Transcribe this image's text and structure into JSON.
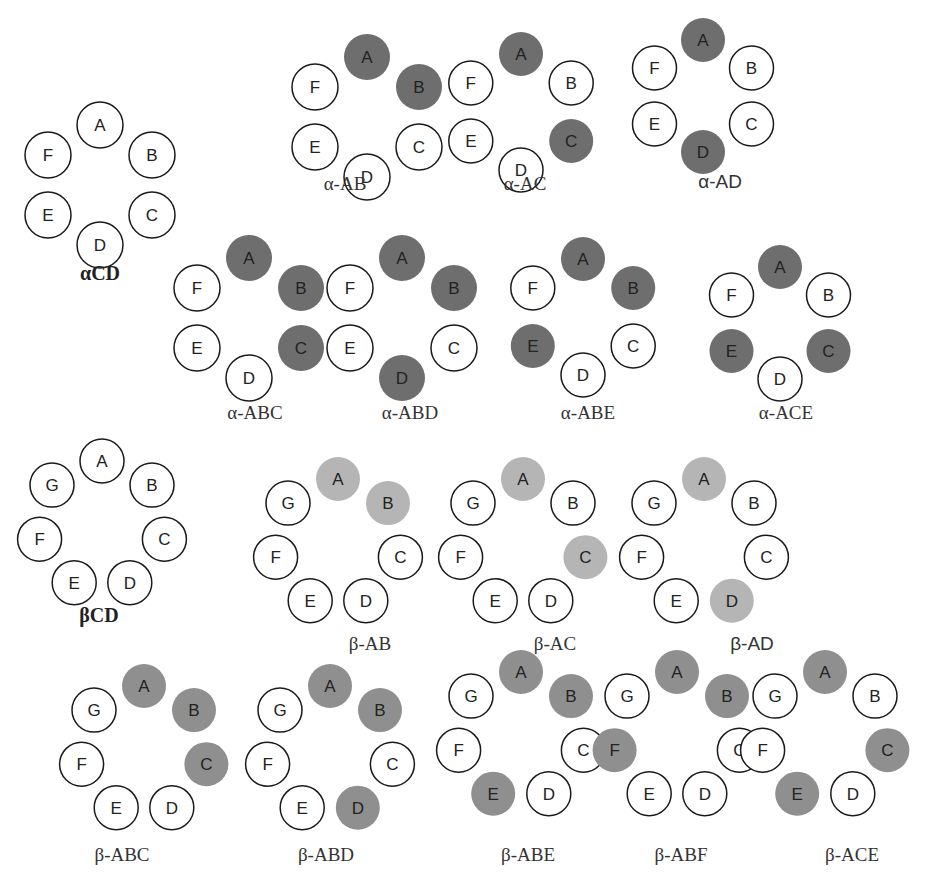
{
  "figure": {
    "colors": {
      "unsubstituted_fill": "#ffffff",
      "outline": "#1a1a1a",
      "alpha_substituted": "#6e6e6e",
      "beta_light_substituted": "#b5b5b5",
      "beta_substituted": "#8f8f8f"
    }
  },
  "diagrams": [
    {
      "id": "alpha-cd",
      "label": "αCD",
      "label_style": "bold",
      "units": [
        "A",
        "B",
        "C",
        "D",
        "E",
        "F"
      ],
      "substituted": [],
      "cx": 100,
      "cy": 185,
      "r": 60,
      "cr": 23,
      "label_x": 100,
      "label_y": 280,
      "shade": "alpha_substituted"
    },
    {
      "id": "alpha-ab",
      "label": "α-AB",
      "label_style": "serif",
      "units": [
        "A",
        "B",
        "C",
        "D",
        "E",
        "F"
      ],
      "substituted": [
        "A",
        "B"
      ],
      "cx": 367,
      "cy": 117,
      "r": 60,
      "cr": 23,
      "label_x": 345,
      "label_y": 190,
      "shade": "alpha_substituted"
    },
    {
      "id": "alpha-ac",
      "label": "α-AC",
      "label_style": "serif",
      "units": [
        "A",
        "B",
        "C",
        "D",
        "E",
        "F"
      ],
      "substituted": [
        "A",
        "C"
      ],
      "cx": 521,
      "cy": 112,
      "r": 58,
      "cr": 22,
      "label_x": 525,
      "label_y": 190,
      "shade": "alpha_substituted"
    },
    {
      "id": "alpha-ad",
      "label": "α-AD",
      "label_style": "sans",
      "units": [
        "A",
        "B",
        "C",
        "D",
        "E",
        "F"
      ],
      "substituted": [
        "A",
        "D"
      ],
      "cx": 703,
      "cy": 96,
      "r": 56,
      "cr": 22,
      "label_x": 720,
      "label_y": 188,
      "shade": "alpha_substituted"
    },
    {
      "id": "alpha-abc",
      "label": "α-ABC",
      "label_style": "serif",
      "units": [
        "A",
        "B",
        "C",
        "D",
        "E",
        "F"
      ],
      "substituted": [
        "A",
        "B",
        "C"
      ],
      "cx": 249,
      "cy": 318,
      "r": 60,
      "cr": 23,
      "label_x": 255,
      "label_y": 419,
      "shade": "alpha_substituted"
    },
    {
      "id": "alpha-abd",
      "label": "α-ABD",
      "label_style": "serif",
      "units": [
        "A",
        "B",
        "C",
        "D",
        "E",
        "F"
      ],
      "substituted": [
        "A",
        "B",
        "D"
      ],
      "cx": 402,
      "cy": 318,
      "r": 60,
      "cr": 23,
      "label_x": 410,
      "label_y": 419,
      "shade": "alpha_substituted"
    },
    {
      "id": "alpha-abe",
      "label": "α-ABE",
      "label_style": "serif",
      "units": [
        "A",
        "B",
        "C",
        "D",
        "E",
        "F"
      ],
      "substituted": [
        "A",
        "B",
        "E"
      ],
      "cx": 583,
      "cy": 317,
      "r": 58,
      "cr": 22,
      "label_x": 588,
      "label_y": 419,
      "shade": "alpha_substituted"
    },
    {
      "id": "alpha-ace",
      "label": "α-ACE",
      "label_style": "serif",
      "units": [
        "A",
        "B",
        "C",
        "D",
        "E",
        "F"
      ],
      "substituted": [
        "A",
        "C",
        "E"
      ],
      "cx": 780,
      "cy": 323,
      "r": 56,
      "cr": 22,
      "label_x": 786,
      "label_y": 419,
      "shade": "alpha_substituted"
    },
    {
      "id": "beta-cd",
      "label": "βCD",
      "label_style": "bold",
      "units": [
        "A",
        "B",
        "C",
        "D",
        "E",
        "F",
        "G"
      ],
      "substituted": [],
      "cx": 102,
      "cy": 525,
      "r": 64,
      "cr": 22,
      "label_x": 99,
      "label_y": 622,
      "shade": "beta_substituted"
    },
    {
      "id": "beta-ab",
      "label": "β-AB",
      "label_style": "serif",
      "units": [
        "A",
        "B",
        "C",
        "D",
        "E",
        "F",
        "G"
      ],
      "substituted": [
        "A",
        "B"
      ],
      "cx": 338,
      "cy": 543,
      "r": 64,
      "cr": 22,
      "label_x": 370,
      "label_y": 650,
      "shade": "beta_light_substituted"
    },
    {
      "id": "beta-ac",
      "label": "β-AC",
      "label_style": "serif",
      "units": [
        "A",
        "B",
        "C",
        "D",
        "E",
        "F",
        "G"
      ],
      "substituted": [
        "A",
        "C"
      ],
      "cx": 523,
      "cy": 543,
      "r": 64,
      "cr": 22,
      "label_x": 555,
      "label_y": 650,
      "shade": "beta_light_substituted"
    },
    {
      "id": "beta-ad",
      "label": "β-AD",
      "label_style": "sans",
      "units": [
        "A",
        "B",
        "C",
        "D",
        "E",
        "F",
        "G"
      ],
      "substituted": [
        "A",
        "D"
      ],
      "cx": 704,
      "cy": 543,
      "r": 64,
      "cr": 22,
      "label_x": 752,
      "label_y": 650,
      "shade": "beta_light_substituted"
    },
    {
      "id": "beta-abc",
      "label": "β-ABC",
      "label_style": "serif",
      "units": [
        "A",
        "B",
        "C",
        "D",
        "E",
        "F",
        "G"
      ],
      "substituted": [
        "A",
        "B",
        "C"
      ],
      "cx": 144,
      "cy": 750,
      "r": 64,
      "cr": 22,
      "label_x": 122,
      "label_y": 861,
      "shade": "beta_substituted"
    },
    {
      "id": "beta-abd",
      "label": "β-ABD",
      "label_style": "serif",
      "units": [
        "A",
        "B",
        "C",
        "D",
        "E",
        "F",
        "G"
      ],
      "substituted": [
        "A",
        "B",
        "D"
      ],
      "cx": 330,
      "cy": 750,
      "r": 64,
      "cr": 22,
      "label_x": 326,
      "label_y": 861,
      "shade": "beta_substituted"
    },
    {
      "id": "beta-abe",
      "label": "β-ABE",
      "label_style": "serif",
      "units": [
        "A",
        "B",
        "C",
        "D",
        "E",
        "F",
        "G"
      ],
      "substituted": [
        "A",
        "B",
        "E"
      ],
      "cx": 521,
      "cy": 736,
      "r": 64,
      "cr": 22,
      "label_x": 528,
      "label_y": 861,
      "shade": "beta_substituted"
    },
    {
      "id": "beta-abf",
      "label": "β-ABF",
      "label_style": "serif",
      "units": [
        "A",
        "B",
        "C",
        "D",
        "E",
        "F",
        "G"
      ],
      "substituted": [
        "A",
        "B",
        "F"
      ],
      "cx": 677,
      "cy": 736,
      "r": 64,
      "cr": 22,
      "label_x": 681,
      "label_y": 861,
      "shade": "beta_substituted"
    },
    {
      "id": "beta-ace",
      "label": "β-ACE",
      "label_style": "serif",
      "units": [
        "A",
        "B",
        "C",
        "D",
        "E",
        "F",
        "G"
      ],
      "substituted": [
        "A",
        "C",
        "E"
      ],
      "cx": 825,
      "cy": 736,
      "r": 64,
      "cr": 22,
      "label_x": 852,
      "label_y": 861,
      "shade": "beta_substituted"
    }
  ]
}
